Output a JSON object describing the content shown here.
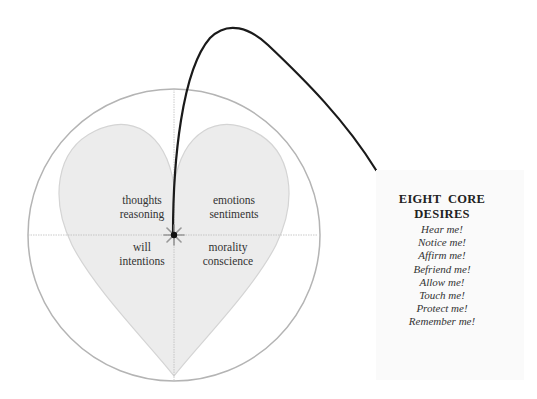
{
  "diagram": {
    "quadrants": {
      "top_left": {
        "line1": "thoughts",
        "line2": "reasoning"
      },
      "top_right": {
        "line1": "emotions",
        "line2": "sentiments"
      },
      "bottom_left": {
        "line1": "will",
        "line2": "intentions"
      },
      "bottom_right": {
        "line1": "morality",
        "line2": "conscience"
      }
    },
    "center_marker": "star-burst",
    "colors": {
      "circle_stroke": "#b4b4b4",
      "heart_fill": "#ececec",
      "heart_stroke": "#d4d4d4",
      "axis_line": "#bdbdbd",
      "arrow_curve": "#1a1a1a"
    }
  },
  "card": {
    "title_line1": "EIGHT  CORE",
    "title_line2": "DESIRES",
    "desires": [
      "Hear me!",
      "Notice me!",
      "Affirm me!",
      "Befriend me!",
      "Allow me!",
      "Touch me!",
      "Protect me!",
      "Remember me!"
    ]
  }
}
